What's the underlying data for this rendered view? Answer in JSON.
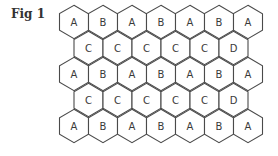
{
  "figure": {
    "label": "Fig 1",
    "rows": [
      [
        "A",
        "B",
        "A",
        "B",
        "A",
        "B",
        "A"
      ],
      [
        "C",
        "C",
        "C",
        "C",
        "C",
        "D"
      ],
      [
        "A",
        "B",
        "A",
        "B",
        "A",
        "B",
        "A"
      ],
      [
        "C",
        "C",
        "C",
        "C",
        "C",
        "D"
      ],
      [
        "A",
        "B",
        "A",
        "B",
        "A",
        "B",
        "A"
      ]
    ],
    "colors": {
      "stroke": "#4a4a4a",
      "fill": "#ffffff",
      "text": "#3a3a3a"
    }
  }
}
